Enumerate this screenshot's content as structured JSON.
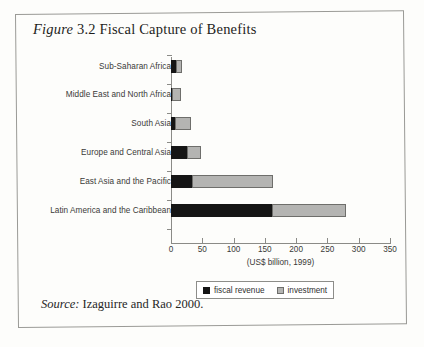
{
  "figure": {
    "label": "Figure",
    "number": "3.2",
    "title": "Fiscal Capture of Benefits",
    "full_title": "Figure 3.2 Fiscal Capture of Benefits"
  },
  "source": {
    "label": "Source:",
    "text": "Izaguirre and Rao 2000.",
    "full": "Source: Izaguirre and Rao 2000."
  },
  "legend": {
    "items": [
      {
        "label": "fiscal revenue",
        "color": "#151515",
        "key": "revenue"
      },
      {
        "label": "investment",
        "color": "#b4b4b2",
        "key": "investment"
      }
    ]
  },
  "chart_data": {
    "type": "bar",
    "orientation": "horizontal",
    "stacked": true,
    "title": "Fiscal Capture of Benefits",
    "xlabel": "(US$ billion, 1999)",
    "ylabel": "",
    "xlim": [
      0,
      350
    ],
    "xticks": [
      0,
      50,
      100,
      150,
      200,
      250,
      300,
      350
    ],
    "xtick_labels": [
      "0",
      "50",
      "100",
      "150",
      "200",
      "250",
      "300",
      "350"
    ],
    "grid": false,
    "legend_position": "bottom-center",
    "categories": [
      "Sub-Saharan Africa",
      "Middle East and North Africa",
      "South Asia",
      "Europe and Central Asia",
      "East Asia and the Pacific",
      "Latin America and the Caribbean"
    ],
    "series": [
      {
        "name": "fiscal revenue",
        "color": "#151515",
        "values": [
          8,
          1,
          7,
          26,
          33,
          162
        ]
      },
      {
        "name": "investment",
        "color": "#b4b4b2",
        "values": [
          10,
          15,
          25,
          22,
          130,
          118
        ]
      }
    ],
    "totals": [
      18,
      16,
      32,
      48,
      163,
      280
    ],
    "units": "US$ billion, 1999"
  }
}
